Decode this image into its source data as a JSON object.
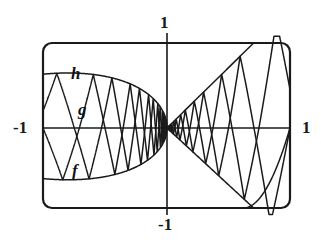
{
  "figure": {
    "background_color": "#ffffff",
    "stroke_color": "#1a1a1a"
  },
  "frame": {
    "name": "plot-border",
    "left": 43,
    "top": 43,
    "right": 290,
    "bottom": 208,
    "corner_radius": 9,
    "stroke_width": 2.2
  },
  "axes": {
    "x_axis_y": 128,
    "y_axis_x": 167,
    "stroke_width": 1.6,
    "labels": {
      "top": "1",
      "left": "-1",
      "right": "1",
      "bottom": "-1"
    }
  },
  "curve_labels": {
    "h": "h",
    "g": "g",
    "f": "f"
  },
  "chart_data": {
    "type": "line",
    "title": "",
    "xlabel": "",
    "ylabel": "",
    "xlim": [
      -1,
      1
    ],
    "ylim": [
      -1,
      1
    ],
    "xticks": [
      -1,
      1
    ],
    "xticklabels": [
      "-1",
      "1"
    ],
    "yticks": [
      -1,
      1
    ],
    "yticklabels": [
      "-1",
      "1"
    ],
    "grid": false,
    "legend": "inline-curve-labels",
    "annotations": [
      {
        "text": "h",
        "x": -0.62,
        "y": 0.62
      },
      {
        "text": "g",
        "x": -0.55,
        "y": 0.28
      },
      {
        "text": "f",
        "x": -0.61,
        "y": -0.44
      }
    ],
    "series": [
      {
        "name": "f",
        "description": "smooth envelope, upper and lower lens-shaped arcs on the left meeting at x=-1 and x=0, diverging straight envelope on the right",
        "kind": "envelope"
      },
      {
        "name": "g",
        "description": "sawtooth oscillation with geometrically shrinking period, amplitude bounded by the envelope",
        "kind": "sawtooth"
      },
      {
        "name": "h",
        "description": "second sawtooth oscillation phase-shifted from g, amplitude bounded by the envelope",
        "kind": "sawtooth"
      }
    ]
  }
}
